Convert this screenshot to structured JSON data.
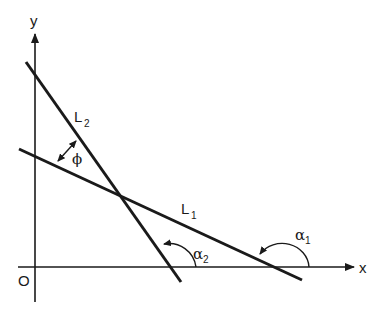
{
  "diagram": {
    "colors": {
      "ink": "#1a1a1a",
      "background": "#ffffff"
    },
    "axes": {
      "x_label": "x",
      "y_label": "y",
      "origin_label": "O"
    },
    "lines": [
      {
        "id": "L1",
        "label": "L",
        "subscript": "1",
        "from": [
          19,
          149
        ],
        "to": [
          302,
          280
        ]
      },
      {
        "id": "L2",
        "label": "L",
        "subscript": "2",
        "from": [
          26,
          62
        ],
        "to": [
          181,
          282
        ]
      }
    ],
    "angles": [
      {
        "id": "alpha1",
        "label": "α",
        "subscript": "1",
        "description": "angle of inclination of L1 from x-axis"
      },
      {
        "id": "alpha2",
        "label": "α",
        "subscript": "2",
        "description": "angle of inclination of L2 from x-axis"
      },
      {
        "id": "phi",
        "label": "ϕ",
        "description": "angle between L1 and L2"
      }
    ],
    "intersection": [
      120,
      196
    ]
  }
}
